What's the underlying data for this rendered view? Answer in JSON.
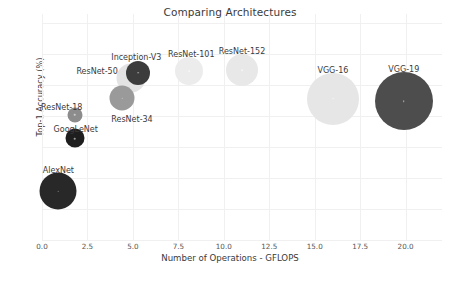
{
  "chart_data": {
    "type": "scatter",
    "title": "Comparing Architectures",
    "xlabel": "Number of Operations - GFLOPS",
    "ylabel": "Top-1 Accuracy (%)",
    "xlim": [
      0.0,
      22.0
    ],
    "ylim": [
      50,
      86.5
    ],
    "xticks": [
      "0.0",
      "2.5",
      "5.0",
      "7.5",
      "10.0",
      "12.5",
      "15.0",
      "17.5",
      "20.0"
    ],
    "xtick_values": [
      0.0,
      2.5,
      5.0,
      7.5,
      10.0,
      12.5,
      15.0,
      17.5,
      20.0
    ],
    "yticks": [
      "50",
      "55",
      "60",
      "65",
      "70",
      "75",
      "80",
      "85"
    ],
    "ytick_values": [
      50,
      55,
      60,
      65,
      70,
      75,
      80,
      85
    ],
    "grid": true,
    "legend": "none",
    "size_encoding": "bubble-radius-encodes-parameter-count",
    "points": [
      {
        "name": "AlexNet",
        "x": 0.9,
        "y": 57.9,
        "r": 18.5,
        "color": "#282828",
        "label_dx": 0,
        "label_dy": -25
      },
      {
        "name": "ResNet-18",
        "x": 1.8,
        "y": 70.2,
        "r": 7.5,
        "color": "#8c8c8c",
        "label_dx": -13,
        "label_dy": -12
      },
      {
        "name": "GoogLeNet",
        "x": 1.8,
        "y": 66.4,
        "r": 9.5,
        "color": "#1e1e1e",
        "label_dx": 1,
        "label_dy": -13
      },
      {
        "name": "ResNet-34",
        "x": 4.4,
        "y": 72.9,
        "r": 12.5,
        "color": "#9a9a9a",
        "label_dx": 10,
        "label_dy": 17
      },
      {
        "name": "ResNet-50",
        "x": 4.9,
        "y": 76.1,
        "r": 14.5,
        "color": "#e3e3e3",
        "label_dx": -34,
        "label_dy": -11
      },
      {
        "name": "Inception-V3",
        "x": 5.3,
        "y": 77.0,
        "r": 12.0,
        "color": "#3c3c3c",
        "label_dx": -2,
        "label_dy": -20
      },
      {
        "name": "ResNet-101",
        "x": 8.1,
        "y": 77.3,
        "r": 14.0,
        "color": "#ececec",
        "label_dx": 2,
        "label_dy": -21
      },
      {
        "name": "ResNet-152",
        "x": 11.0,
        "y": 77.4,
        "r": 16.0,
        "color": "#e8e8e8",
        "label_dx": 0,
        "label_dy": -23
      },
      {
        "name": "VGG-16",
        "x": 16.0,
        "y": 72.8,
        "r": 26.0,
        "color": "#e6e6e6",
        "label_dx": 0,
        "label_dy": -33
      },
      {
        "name": "VGG-19",
        "x": 19.9,
        "y": 72.4,
        "r": 29.0,
        "color": "#4d4d4d",
        "label_dx": 0,
        "label_dy": -36
      }
    ]
  },
  "colors": {
    "background": "#ffffff",
    "grid": "#f0f0f0",
    "tick_text": "#555555",
    "axis_text": "#3a3a3a"
  }
}
